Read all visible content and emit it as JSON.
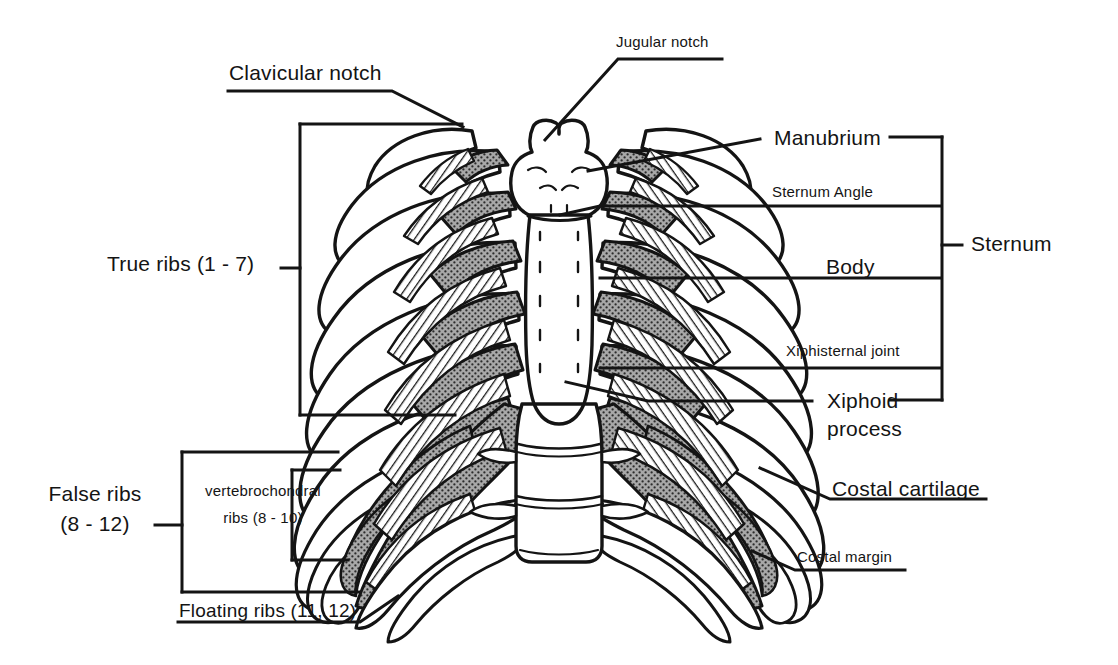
{
  "figure": {
    "background_color": "#ffffff",
    "ink_color": "#141414",
    "cartilage_fill": "#8d8d8d",
    "bone_fill": "#ffffff"
  },
  "labels": {
    "jugular_notch": "Jugular notch",
    "clavicular_notch": "Clavicular notch",
    "manubrium": "Manubrium",
    "sternum_angle": "Sternum Angle",
    "body": "Body",
    "xiphisternal_joint": "Xiphisternal joint",
    "xiphoid_line1": "Xiphoid",
    "xiphoid_line2": "process",
    "sternum": "Sternum",
    "true_ribs": "True ribs (1 - 7)",
    "false_ribs_line1": "False ribs",
    "false_ribs_line2": "(8 - 12)",
    "vertebrochondral_line1": "vertebrochondral",
    "vertebrochondral_line2": "ribs (8 - 10)",
    "floating_ribs": "Floating ribs (11, 12)",
    "costal_cartilage": "Costal cartilage",
    "costal_margin": "Costal margin"
  },
  "groups": {
    "sternum_parts": [
      "Manubrium",
      "Sternum Angle",
      "Body",
      "Xiphisternal joint",
      "Xiphoid process"
    ],
    "rib_classes": [
      "True ribs (1 - 7)",
      "False ribs (8 - 12)"
    ],
    "false_rib_subclasses": [
      "vertebrochondral ribs (8 - 10)",
      "Floating ribs (11, 12)"
    ]
  }
}
